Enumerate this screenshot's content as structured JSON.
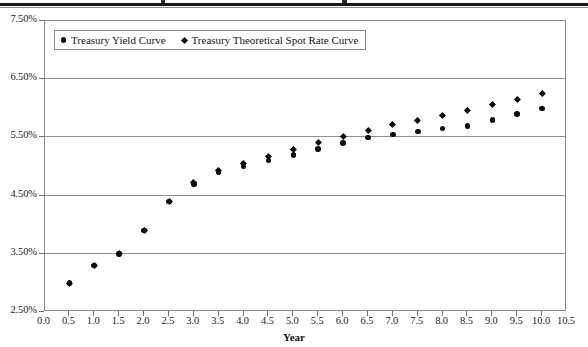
{
  "figure": {
    "title_cut_off": true,
    "xaxis_title": "Year",
    "legend": {
      "entries": [
        {
          "marker": "circle-marker-icon",
          "label": "Treasury Yield Curve"
        },
        {
          "marker": "diamond-marker-icon",
          "label": "Treasury Theoretical Spot Rate Curve"
        }
      ]
    },
    "colors": {
      "marker": "#0b0b0b",
      "gridline": "#8f8f8f",
      "frame": "#8a8a8a",
      "background": "#ffffff",
      "text": "#1b1b1b"
    }
  },
  "axes": {
    "y_tick_labels": [
      "7.50%",
      "6.50%",
      "5.50%",
      "4.50%",
      "3.50%",
      "2.50%"
    ],
    "x_tick_labels": [
      "0.0",
      "0.5",
      "1.0",
      "1.5",
      "2.0",
      "2.5",
      "3.0",
      "3.5",
      "4.0",
      "4.5",
      "5.0",
      "5.5",
      "6.0",
      "6.5",
      "7.0",
      "7.5",
      "8.0",
      "8.5",
      "9.0",
      "9.5",
      "10.0",
      "10.5"
    ]
  },
  "chart_data": {
    "type": "scatter",
    "xlabel": "Year",
    "ylabel": "",
    "xlim": [
      0.0,
      10.5
    ],
    "ylim": [
      2.5,
      7.5
    ],
    "ytick_values": [
      2.5,
      3.5,
      4.5,
      5.5,
      6.5,
      7.5
    ],
    "ytick_format": "percent",
    "xtick_step": 0.5,
    "grid": "horizontal",
    "legend_position": "top-left-inside",
    "x": [
      0.5,
      1.0,
      1.5,
      2.0,
      2.5,
      3.0,
      3.5,
      4.0,
      4.5,
      5.0,
      5.5,
      6.0,
      6.5,
      7.0,
      7.5,
      8.0,
      8.5,
      9.0,
      9.5,
      10.0
    ],
    "series": [
      {
        "name": "Treasury Yield Curve",
        "marker": "circle",
        "values": [
          3.0,
          3.3,
          3.5,
          3.9,
          4.4,
          4.7,
          4.9,
          5.0,
          5.1,
          5.2,
          5.3,
          5.4,
          5.5,
          5.55,
          5.6,
          5.65,
          5.7,
          5.8,
          5.9,
          6.0
        ]
      },
      {
        "name": "Treasury Theoretical Spot Rate Curve",
        "marker": "diamond",
        "values": [
          3.0,
          3.3,
          3.5,
          3.9,
          4.4,
          4.72,
          4.93,
          5.05,
          5.18,
          5.3,
          5.42,
          5.52,
          5.62,
          5.72,
          5.8,
          5.88,
          5.96,
          6.06,
          6.15,
          6.25
        ]
      }
    ]
  }
}
